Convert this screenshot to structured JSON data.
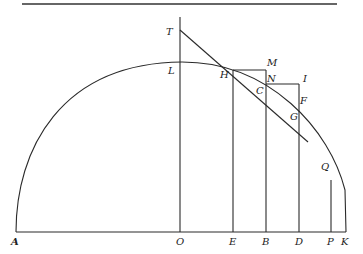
{
  "diagram": {
    "type": "geometric-construction",
    "stroke_color": "#2a2a2a",
    "background": "#ffffff",
    "labels": {
      "T": "T",
      "L": "L",
      "M": "M",
      "H": "H",
      "N": "N",
      "I": "I",
      "C": "C",
      "F": "F",
      "G": "G",
      "Q": "Q",
      "A": "A",
      "O": "O",
      "E": "E",
      "B": "B",
      "D": "D",
      "P": "P",
      "K": "K"
    },
    "points": {
      "A": [
        16,
        232
      ],
      "O": [
        180,
        232
      ],
      "K": [
        346,
        232
      ],
      "L": [
        180,
        62
      ],
      "T": [
        180,
        30
      ],
      "H": [
        233,
        70
      ],
      "M": [
        266,
        70
      ],
      "N": [
        266,
        80
      ],
      "C": [
        266,
        84
      ],
      "I": [
        299,
        80
      ],
      "G": [
        299,
        108
      ],
      "F": [
        305,
        103
      ],
      "Q": [
        331,
        183
      ],
      "E": [
        233,
        232
      ],
      "B": [
        266,
        232
      ],
      "D": [
        299,
        232
      ],
      "P": [
        331,
        232
      ]
    }
  }
}
